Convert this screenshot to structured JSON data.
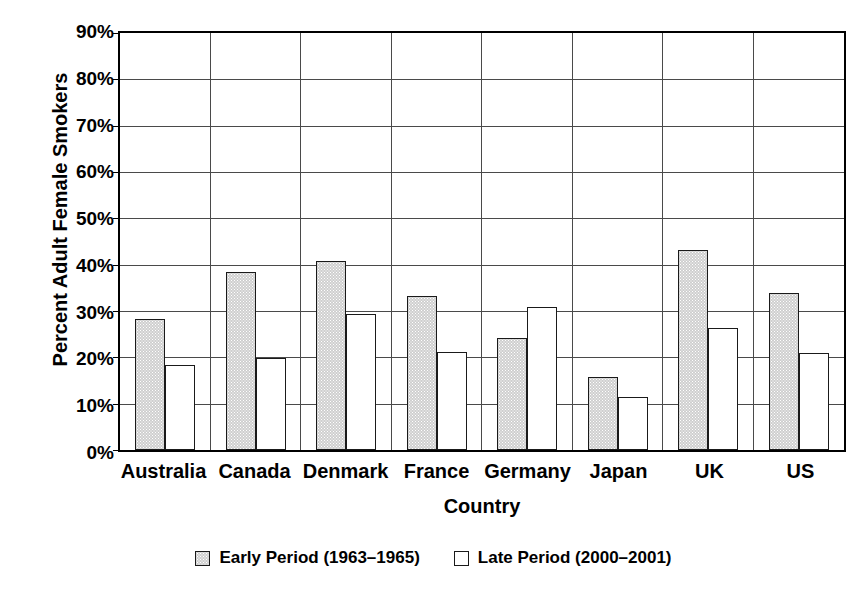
{
  "chart_data": {
    "type": "bar",
    "title": "",
    "xlabel": "Country",
    "ylabel": "Percent Adult Female Smokers",
    "ylim": [
      0,
      90
    ],
    "ytick_step": 10,
    "ytick_labels": [
      "90%",
      "80%",
      "70%",
      "60%",
      "50%",
      "40%",
      "30%",
      "20%",
      "10%",
      "0%"
    ],
    "ytick_values": [
      90,
      80,
      70,
      60,
      50,
      40,
      30,
      20,
      10,
      0
    ],
    "grid": "horizontal",
    "legend_position": "bottom-center",
    "categories": [
      "Australia",
      "Canada",
      "Denmark",
      "France",
      "Germany",
      "Japan",
      "UK",
      "US"
    ],
    "series": [
      {
        "name": "Early Period (1963–1965)",
        "key": "early",
        "fill": "#cfcfcf",
        "values": [
          28.0,
          38.0,
          40.5,
          33.0,
          24.0,
          15.7,
          42.8,
          33.6
        ]
      },
      {
        "name": "Late Period (2000–2001)",
        "key": "late",
        "fill": "#ffffff",
        "values": [
          18.2,
          19.6,
          29.0,
          21.0,
          30.5,
          11.3,
          26.0,
          20.7
        ]
      }
    ]
  },
  "legend": {
    "items": [
      {
        "label": "Early Period (1963–1965)",
        "swatch": "early"
      },
      {
        "label": "Late Period (2000–2001)",
        "swatch": "late"
      }
    ]
  }
}
